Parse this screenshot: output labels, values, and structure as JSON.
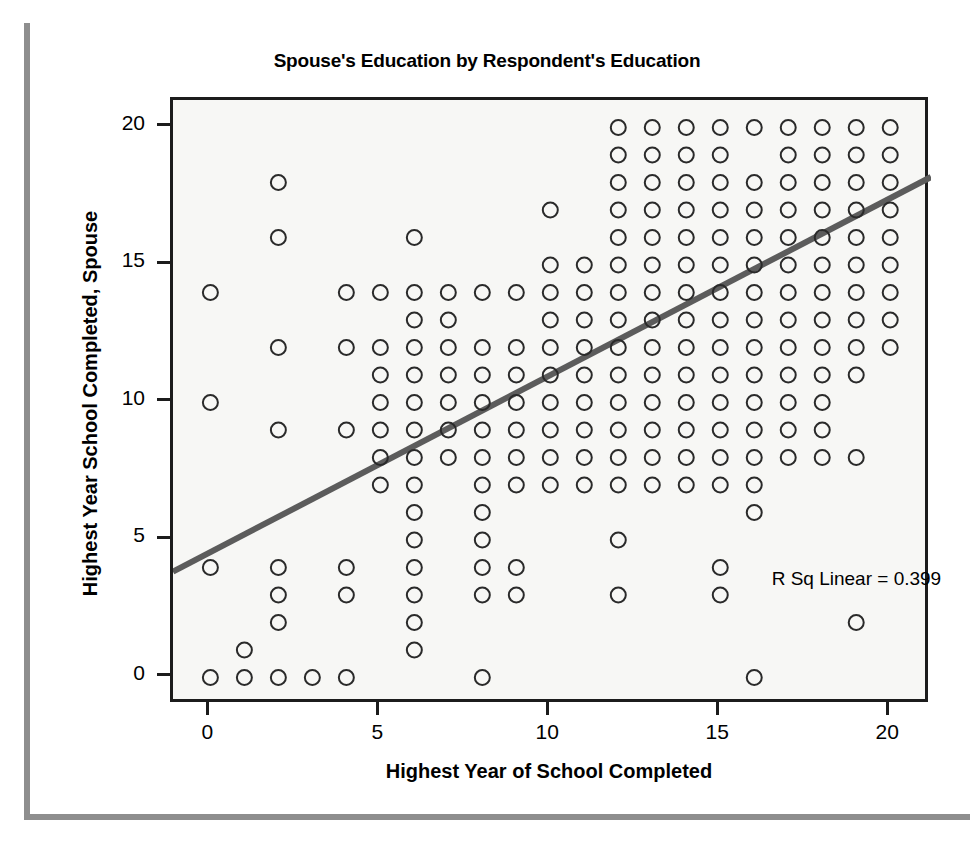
{
  "chart_data": {
    "type": "scatter",
    "title": "Spouse's Education by Respondent's Education",
    "xlabel": "Highest Year of School Completed",
    "ylabel": "Highest Year School Completed, Spouse",
    "xlim": [
      -1.1,
      21.2
    ],
    "ylim": [
      -1.0,
      21.0
    ],
    "xticks": [
      0,
      5,
      10,
      15,
      20
    ],
    "yticks": [
      0,
      5,
      10,
      15,
      20
    ],
    "xtick_labels": [
      "0",
      "5",
      "10",
      "15",
      "20"
    ],
    "ytick_labels": [
      "0",
      "5",
      "10",
      "15",
      "20"
    ],
    "grid": false,
    "legend": null,
    "marker": "open-circle",
    "marker_color": "#2a2a2a",
    "plot_background": "#f7f7f5",
    "frame_color": "#1c1c1c",
    "annotations": [
      {
        "text": "R Sq Linear = 0.399",
        "x": 16.6,
        "y": 3.4
      }
    ],
    "fit_line": {
      "label": "linear fit",
      "color": "#5c5c5c",
      "r_squared": 0.399,
      "slope": 0.6455,
      "intercept": 4.4955,
      "x_start": -1.1,
      "x_end": 21.2,
      "y_start": 3.85,
      "y_end": 18.2
    },
    "points": [
      [
        0,
        14
      ],
      [
        0,
        10
      ],
      [
        0,
        4
      ],
      [
        0,
        0
      ],
      [
        1,
        1
      ],
      [
        1,
        0
      ],
      [
        2,
        18
      ],
      [
        2,
        16
      ],
      [
        2,
        12
      ],
      [
        2,
        9
      ],
      [
        2,
        4
      ],
      [
        2,
        3
      ],
      [
        2,
        2
      ],
      [
        2,
        0
      ],
      [
        3,
        0
      ],
      [
        4,
        14
      ],
      [
        4,
        12
      ],
      [
        4,
        9
      ],
      [
        4,
        4
      ],
      [
        4,
        3
      ],
      [
        4,
        0
      ],
      [
        5,
        14
      ],
      [
        5,
        12
      ],
      [
        5,
        11
      ],
      [
        5,
        10
      ],
      [
        5,
        9
      ],
      [
        5,
        8
      ],
      [
        5,
        7
      ],
      [
        6,
        16
      ],
      [
        6,
        14
      ],
      [
        6,
        13
      ],
      [
        6,
        12
      ],
      [
        6,
        11
      ],
      [
        6,
        10
      ],
      [
        6,
        9
      ],
      [
        6,
        8
      ],
      [
        6,
        7
      ],
      [
        6,
        6
      ],
      [
        6,
        5
      ],
      [
        6,
        4
      ],
      [
        6,
        3
      ],
      [
        6,
        2
      ],
      [
        6,
        1
      ],
      [
        7,
        14
      ],
      [
        7,
        13
      ],
      [
        7,
        12
      ],
      [
        7,
        11
      ],
      [
        7,
        10
      ],
      [
        7,
        9
      ],
      [
        7,
        8
      ],
      [
        8,
        14
      ],
      [
        8,
        12
      ],
      [
        8,
        11
      ],
      [
        8,
        10
      ],
      [
        8,
        9
      ],
      [
        8,
        8
      ],
      [
        8,
        7
      ],
      [
        8,
        6
      ],
      [
        8,
        5
      ],
      [
        8,
        4
      ],
      [
        8,
        3
      ],
      [
        8,
        0
      ],
      [
        9,
        14
      ],
      [
        9,
        12
      ],
      [
        9,
        11
      ],
      [
        9,
        10
      ],
      [
        9,
        9
      ],
      [
        9,
        8
      ],
      [
        9,
        7
      ],
      [
        9,
        4
      ],
      [
        9,
        3
      ],
      [
        10,
        17
      ],
      [
        10,
        15
      ],
      [
        10,
        14
      ],
      [
        10,
        13
      ],
      [
        10,
        12
      ],
      [
        10,
        11
      ],
      [
        10,
        10
      ],
      [
        10,
        9
      ],
      [
        10,
        8
      ],
      [
        10,
        7
      ],
      [
        11,
        15
      ],
      [
        11,
        14
      ],
      [
        11,
        13
      ],
      [
        11,
        12
      ],
      [
        11,
        11
      ],
      [
        11,
        10
      ],
      [
        11,
        9
      ],
      [
        11,
        8
      ],
      [
        11,
        7
      ],
      [
        12,
        20
      ],
      [
        12,
        19
      ],
      [
        12,
        18
      ],
      [
        12,
        17
      ],
      [
        12,
        16
      ],
      [
        12,
        15
      ],
      [
        12,
        14
      ],
      [
        12,
        13
      ],
      [
        12,
        12
      ],
      [
        12,
        11
      ],
      [
        12,
        10
      ],
      [
        12,
        9
      ],
      [
        12,
        8
      ],
      [
        12,
        7
      ],
      [
        12,
        5
      ],
      [
        12,
        3
      ],
      [
        13,
        20
      ],
      [
        13,
        19
      ],
      [
        13,
        18
      ],
      [
        13,
        17
      ],
      [
        13,
        16
      ],
      [
        13,
        15
      ],
      [
        13,
        14
      ],
      [
        13,
        13
      ],
      [
        13,
        12
      ],
      [
        13,
        11
      ],
      [
        13,
        10
      ],
      [
        13,
        9
      ],
      [
        13,
        8
      ],
      [
        13,
        7
      ],
      [
        14,
        20
      ],
      [
        14,
        19
      ],
      [
        14,
        18
      ],
      [
        14,
        17
      ],
      [
        14,
        16
      ],
      [
        14,
        15
      ],
      [
        14,
        14
      ],
      [
        14,
        13
      ],
      [
        14,
        12
      ],
      [
        14,
        11
      ],
      [
        14,
        10
      ],
      [
        14,
        9
      ],
      [
        14,
        8
      ],
      [
        14,
        7
      ],
      [
        15,
        20
      ],
      [
        15,
        19
      ],
      [
        15,
        18
      ],
      [
        15,
        17
      ],
      [
        15,
        16
      ],
      [
        15,
        15
      ],
      [
        15,
        14
      ],
      [
        15,
        13
      ],
      [
        15,
        12
      ],
      [
        15,
        11
      ],
      [
        15,
        10
      ],
      [
        15,
        9
      ],
      [
        15,
        8
      ],
      [
        15,
        7
      ],
      [
        15,
        4
      ],
      [
        15,
        3
      ],
      [
        16,
        20
      ],
      [
        16,
        18
      ],
      [
        16,
        17
      ],
      [
        16,
        16
      ],
      [
        16,
        15
      ],
      [
        16,
        14
      ],
      [
        16,
        13
      ],
      [
        16,
        12
      ],
      [
        16,
        11
      ],
      [
        16,
        10
      ],
      [
        16,
        9
      ],
      [
        16,
        8
      ],
      [
        16,
        7
      ],
      [
        16,
        6
      ],
      [
        16,
        0
      ],
      [
        17,
        20
      ],
      [
        17,
        19
      ],
      [
        17,
        18
      ],
      [
        17,
        17
      ],
      [
        17,
        16
      ],
      [
        17,
        15
      ],
      [
        17,
        14
      ],
      [
        17,
        13
      ],
      [
        17,
        12
      ],
      [
        17,
        11
      ],
      [
        17,
        10
      ],
      [
        17,
        9
      ],
      [
        17,
        8
      ],
      [
        18,
        20
      ],
      [
        18,
        19
      ],
      [
        18,
        18
      ],
      [
        18,
        17
      ],
      [
        18,
        16
      ],
      [
        18,
        15
      ],
      [
        18,
        14
      ],
      [
        18,
        13
      ],
      [
        18,
        12
      ],
      [
        18,
        11
      ],
      [
        18,
        10
      ],
      [
        18,
        9
      ],
      [
        18,
        8
      ],
      [
        19,
        20
      ],
      [
        19,
        19
      ],
      [
        19,
        18
      ],
      [
        19,
        17
      ],
      [
        19,
        16
      ],
      [
        19,
        15
      ],
      [
        19,
        14
      ],
      [
        19,
        13
      ],
      [
        19,
        12
      ],
      [
        19,
        11
      ],
      [
        19,
        8
      ],
      [
        19,
        2
      ],
      [
        20,
        20
      ],
      [
        20,
        19
      ],
      [
        20,
        18
      ],
      [
        20,
        17
      ],
      [
        20,
        16
      ],
      [
        20,
        15
      ],
      [
        20,
        14
      ],
      [
        20,
        13
      ],
      [
        20,
        12
      ]
    ]
  }
}
